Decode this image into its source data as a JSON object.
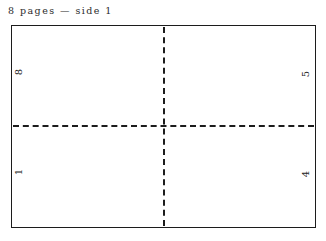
{
  "caption": {
    "text": "8 pages — side 1",
    "page_count": 8,
    "side": 1
  },
  "sheet": {
    "border_color": "#1c1c1c",
    "background_color": "#ffffff",
    "fold_line_color": "#1c1c1c",
    "fold_lines": [
      "vertical",
      "horizontal"
    ]
  },
  "imposition": {
    "rows": 2,
    "columns": 2,
    "rotation_degrees": -90,
    "quadrants": [
      {
        "position": "top-left",
        "page_number": "8"
      },
      {
        "position": "top-right",
        "page_number": "5"
      },
      {
        "position": "bottom-left",
        "page_number": "1"
      },
      {
        "position": "bottom-right",
        "page_number": "4"
      }
    ]
  }
}
